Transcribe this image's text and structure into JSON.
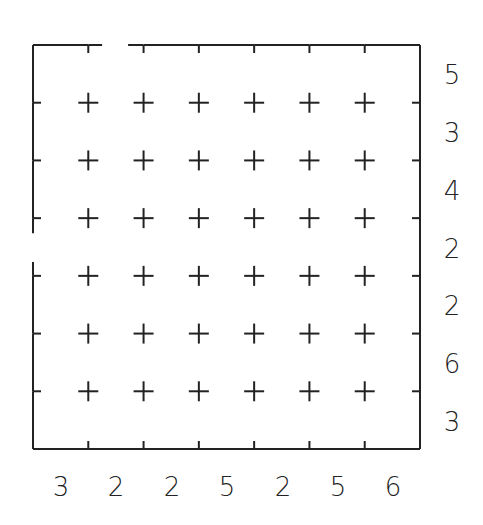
{
  "puzzle": {
    "type": "towers",
    "size": 7,
    "grid": {
      "left": 33,
      "top": 45,
      "right": 420,
      "bottom": 449,
      "line_color": "#222222",
      "openings": [
        {
          "side": "top",
          "column": 2
        },
        {
          "side": "left",
          "row": 4
        }
      ]
    },
    "row_clues": [
      "5",
      "3",
      "4",
      "2",
      "2",
      "6",
      "3"
    ],
    "column_clues": [
      "3",
      "2",
      "2",
      "5",
      "2",
      "5",
      "6"
    ]
  }
}
